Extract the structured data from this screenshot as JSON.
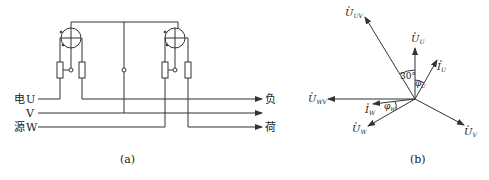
{
  "figure_a": {
    "caption": "(a)",
    "source_label_top": "电",
    "source_label_bottom": "源",
    "phase_labels": [
      "U",
      "V",
      "W"
    ],
    "load_label_top": "负",
    "load_label_bottom": "荷"
  },
  "figure_b": {
    "caption": "(b)",
    "vectors": {
      "U_UV": "U̇UV",
      "U_U": "U̇U",
      "I_U": "İU",
      "U_WV": "U̇WV",
      "I_W": "İW",
      "U_W": "U̇W",
      "U_V": "U̇V"
    },
    "vector_main": {
      "U_UV": "U",
      "U_U": "U",
      "I_U": "I",
      "U_WV": "U",
      "I_W": "I",
      "U_W": "U",
      "U_V": "U"
    },
    "vector_sub": {
      "U_UV": "UV",
      "U_U": "U",
      "I_U": "U",
      "U_WV": "WV",
      "I_W": "W",
      "U_W": "W",
      "U_V": "V"
    },
    "angle_30": "30°",
    "phi": "φ",
    "phi_U_sub": "U",
    "phi_W_sub": "W"
  },
  "colors": {
    "line": "#333333",
    "text": "#222222"
  }
}
